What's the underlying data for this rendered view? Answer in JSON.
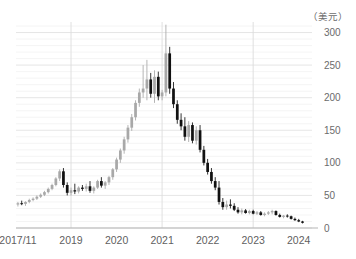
{
  "chart": {
    "unit_label": "（美元）",
    "colors": {
      "up_candle": "#a8a8a8",
      "down_candle": "#111111",
      "grid_minor": "#f1f1f1",
      "grid_major": "#e3e3e3",
      "axis": "#b5b5b5",
      "tick_text": "#6b6b6b",
      "background": "#ffffff"
    }
  },
  "chart_data": {
    "type": "candlestick",
    "title": "",
    "subtitle": "",
    "xlabel": "",
    "ylabel": "",
    "unit": "美元",
    "ylim": [
      0,
      310
    ],
    "yticks": [
      0,
      50,
      100,
      150,
      200,
      250,
      300
    ],
    "ytick_labels": [
      "0",
      "50",
      "100",
      "150",
      "200",
      "250",
      "300"
    ],
    "xticks": [
      "2017/11",
      "2019",
      "2020",
      "2021",
      "2022",
      "2023",
      "2024"
    ],
    "xtick_positions": [
      0,
      14,
      26,
      38,
      50,
      62,
      74
    ],
    "grid": "minor-horizontal-and-major-vertical",
    "legend": "none",
    "x_major_gridlines": [
      14,
      38,
      62
    ],
    "candles": [
      {
        "i": 0,
        "o": 36,
        "h": 40,
        "l": 33,
        "c": 38
      },
      {
        "i": 1,
        "o": 38,
        "h": 42,
        "l": 35,
        "c": 37
      },
      {
        "i": 2,
        "o": 37,
        "h": 41,
        "l": 34,
        "c": 40
      },
      {
        "i": 3,
        "o": 40,
        "h": 45,
        "l": 38,
        "c": 43
      },
      {
        "i": 4,
        "o": 43,
        "h": 47,
        "l": 41,
        "c": 45
      },
      {
        "i": 5,
        "o": 45,
        "h": 50,
        "l": 43,
        "c": 48
      },
      {
        "i": 6,
        "o": 48,
        "h": 53,
        "l": 46,
        "c": 51
      },
      {
        "i": 7,
        "o": 51,
        "h": 57,
        "l": 49,
        "c": 55
      },
      {
        "i": 8,
        "o": 55,
        "h": 62,
        "l": 53,
        "c": 60
      },
      {
        "i": 9,
        "o": 60,
        "h": 68,
        "l": 58,
        "c": 66
      },
      {
        "i": 10,
        "o": 66,
        "h": 78,
        "l": 64,
        "c": 76
      },
      {
        "i": 11,
        "o": 76,
        "h": 90,
        "l": 72,
        "c": 87
      },
      {
        "i": 12,
        "o": 87,
        "h": 92,
        "l": 62,
        "c": 66
      },
      {
        "i": 13,
        "o": 66,
        "h": 70,
        "l": 50,
        "c": 54
      },
      {
        "i": 14,
        "o": 54,
        "h": 62,
        "l": 50,
        "c": 58
      },
      {
        "i": 15,
        "o": 58,
        "h": 68,
        "l": 52,
        "c": 56
      },
      {
        "i": 16,
        "o": 56,
        "h": 64,
        "l": 53,
        "c": 62
      },
      {
        "i": 17,
        "o": 62,
        "h": 66,
        "l": 57,
        "c": 60
      },
      {
        "i": 18,
        "o": 60,
        "h": 68,
        "l": 56,
        "c": 64
      },
      {
        "i": 19,
        "o": 64,
        "h": 72,
        "l": 54,
        "c": 57
      },
      {
        "i": 20,
        "o": 57,
        "h": 64,
        "l": 53,
        "c": 62
      },
      {
        "i": 21,
        "o": 62,
        "h": 74,
        "l": 60,
        "c": 72
      },
      {
        "i": 22,
        "o": 72,
        "h": 78,
        "l": 62,
        "c": 65
      },
      {
        "i": 23,
        "o": 65,
        "h": 72,
        "l": 60,
        "c": 70
      },
      {
        "i": 24,
        "o": 70,
        "h": 80,
        "l": 66,
        "c": 78
      },
      {
        "i": 25,
        "o": 78,
        "h": 92,
        "l": 74,
        "c": 90
      },
      {
        "i": 26,
        "o": 90,
        "h": 108,
        "l": 86,
        "c": 105
      },
      {
        "i": 27,
        "o": 105,
        "h": 122,
        "l": 100,
        "c": 119
      },
      {
        "i": 28,
        "o": 119,
        "h": 140,
        "l": 114,
        "c": 136
      },
      {
        "i": 29,
        "o": 136,
        "h": 158,
        "l": 131,
        "c": 154
      },
      {
        "i": 30,
        "o": 154,
        "h": 175,
        "l": 149,
        "c": 170
      },
      {
        "i": 31,
        "o": 170,
        "h": 196,
        "l": 165,
        "c": 192
      },
      {
        "i": 32,
        "o": 192,
        "h": 214,
        "l": 186,
        "c": 208
      },
      {
        "i": 33,
        "o": 208,
        "h": 250,
        "l": 200,
        "c": 214
      },
      {
        "i": 34,
        "o": 214,
        "h": 258,
        "l": 196,
        "c": 228
      },
      {
        "i": 35,
        "o": 228,
        "h": 238,
        "l": 200,
        "c": 206
      },
      {
        "i": 36,
        "o": 206,
        "h": 242,
        "l": 192,
        "c": 232
      },
      {
        "i": 37,
        "o": 232,
        "h": 240,
        "l": 196,
        "c": 202
      },
      {
        "i": 38,
        "o": 202,
        "h": 212,
        "l": 196,
        "c": 208
      },
      {
        "i": 39,
        "o": 208,
        "h": 312,
        "l": 202,
        "c": 268
      },
      {
        "i": 40,
        "o": 268,
        "h": 278,
        "l": 206,
        "c": 214
      },
      {
        "i": 41,
        "o": 214,
        "h": 224,
        "l": 184,
        "c": 190
      },
      {
        "i": 42,
        "o": 190,
        "h": 196,
        "l": 160,
        "c": 166
      },
      {
        "i": 43,
        "o": 166,
        "h": 176,
        "l": 150,
        "c": 156
      },
      {
        "i": 44,
        "o": 156,
        "h": 170,
        "l": 134,
        "c": 140
      },
      {
        "i": 45,
        "o": 140,
        "h": 164,
        "l": 132,
        "c": 158
      },
      {
        "i": 46,
        "o": 158,
        "h": 162,
        "l": 130,
        "c": 134
      },
      {
        "i": 47,
        "o": 134,
        "h": 156,
        "l": 128,
        "c": 150
      },
      {
        "i": 48,
        "o": 150,
        "h": 158,
        "l": 116,
        "c": 120
      },
      {
        "i": 49,
        "o": 120,
        "h": 126,
        "l": 96,
        "c": 100
      },
      {
        "i": 50,
        "o": 100,
        "h": 106,
        "l": 82,
        "c": 86
      },
      {
        "i": 51,
        "o": 86,
        "h": 92,
        "l": 68,
        "c": 72
      },
      {
        "i": 52,
        "o": 72,
        "h": 78,
        "l": 58,
        "c": 62
      },
      {
        "i": 53,
        "o": 62,
        "h": 72,
        "l": 36,
        "c": 40
      },
      {
        "i": 54,
        "o": 40,
        "h": 46,
        "l": 28,
        "c": 32
      },
      {
        "i": 55,
        "o": 32,
        "h": 42,
        "l": 28,
        "c": 36
      },
      {
        "i": 56,
        "o": 36,
        "h": 44,
        "l": 30,
        "c": 34
      },
      {
        "i": 57,
        "o": 34,
        "h": 38,
        "l": 26,
        "c": 28
      },
      {
        "i": 58,
        "o": 28,
        "h": 32,
        "l": 22,
        "c": 24
      },
      {
        "i": 59,
        "o": 24,
        "h": 30,
        "l": 21,
        "c": 27
      },
      {
        "i": 60,
        "o": 27,
        "h": 29,
        "l": 22,
        "c": 23
      },
      {
        "i": 61,
        "o": 23,
        "h": 28,
        "l": 21,
        "c": 26
      },
      {
        "i": 62,
        "o": 26,
        "h": 28,
        "l": 21,
        "c": 22
      },
      {
        "i": 63,
        "o": 22,
        "h": 26,
        "l": 20,
        "c": 24
      },
      {
        "i": 64,
        "o": 24,
        "h": 26,
        "l": 19,
        "c": 20
      },
      {
        "i": 65,
        "o": 20,
        "h": 24,
        "l": 18,
        "c": 22
      },
      {
        "i": 66,
        "o": 22,
        "h": 26,
        "l": 20,
        "c": 24
      },
      {
        "i": 67,
        "o": 24,
        "h": 28,
        "l": 21,
        "c": 26
      },
      {
        "i": 68,
        "o": 26,
        "h": 27,
        "l": 19,
        "c": 20
      },
      {
        "i": 69,
        "o": 20,
        "h": 22,
        "l": 16,
        "c": 17
      },
      {
        "i": 70,
        "o": 17,
        "h": 20,
        "l": 15,
        "c": 19
      },
      {
        "i": 71,
        "o": 19,
        "h": 21,
        "l": 16,
        "c": 18
      },
      {
        "i": 72,
        "o": 18,
        "h": 19,
        "l": 13,
        "c": 14
      },
      {
        "i": 73,
        "o": 14,
        "h": 16,
        "l": 11,
        "c": 12
      },
      {
        "i": 74,
        "o": 12,
        "h": 14,
        "l": 9,
        "c": 10
      },
      {
        "i": 75,
        "o": 10,
        "h": 11,
        "l": 7,
        "c": 8
      }
    ]
  }
}
